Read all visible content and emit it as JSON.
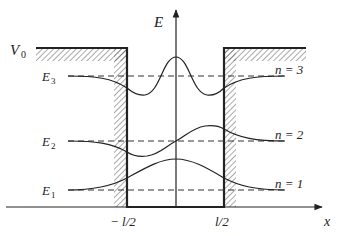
{
  "diagram": {
    "axes": {
      "y_label": "E",
      "x_label": "x",
      "x_ticks": [
        "− l/2",
        "l/2"
      ]
    },
    "potential_label": "V",
    "potential_subscript": "0",
    "levels": [
      {
        "label": "E",
        "subscript": "3",
        "n_label": "n = 3"
      },
      {
        "label": "E",
        "subscript": "2",
        "n_label": "n = 2"
      },
      {
        "label": "E",
        "subscript": "1",
        "n_label": "n = 1"
      }
    ],
    "colors": {
      "line": "#222222",
      "hatch": "#555555",
      "background": "#ffffff"
    }
  }
}
